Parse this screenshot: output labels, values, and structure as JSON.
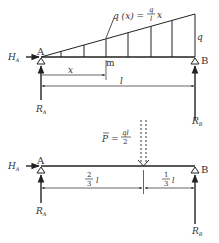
{
  "diagram": {
    "top": {
      "load_label": "q (x) = ",
      "load_frac_num": "q",
      "load_frac_den": "l",
      "load_var": "x",
      "max_load_label": "q",
      "support_a": "A",
      "support_b": "B",
      "point_m": "m",
      "horizontal_reaction": "H",
      "horizontal_reaction_sub": "A",
      "reaction_a": "R",
      "reaction_a_sub": "A",
      "reaction_b": "R",
      "reaction_b_sub": "B",
      "dim_x": "x",
      "dim_l": "l"
    },
    "bottom": {
      "resultant_label": "P = ",
      "resultant_frac_num": "ql",
      "resultant_frac_den": "2",
      "support_a": "A",
      "support_b": "B",
      "horizontal_reaction": "H",
      "horizontal_reaction_sub": "A",
      "reaction_a": "R",
      "reaction_a_sub": "A",
      "reaction_b": "R",
      "reaction_b_sub": "B",
      "dim_left_num": "2",
      "dim_left_den": "3",
      "dim_left_var": "l",
      "dim_right_num": "1",
      "dim_right_den": "3",
      "dim_right_var": "l"
    },
    "colors": {
      "ink": "#333333",
      "background": "#ffffff"
    }
  }
}
